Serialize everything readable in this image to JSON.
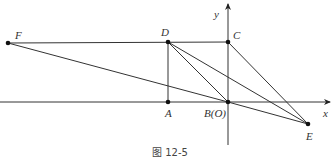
{
  "figure": {
    "caption": "图 12-5",
    "axes": {
      "x_label": "x",
      "y_label": "y"
    },
    "points": {
      "F": {
        "label": "F",
        "x": 8,
        "y": 43
      },
      "D": {
        "label": "D",
        "x": 168,
        "y": 42
      },
      "C": {
        "label": "C",
        "x": 228,
        "y": 42
      },
      "A": {
        "label": "A",
        "x": 168,
        "y": 102
      },
      "B": {
        "label": "B(O)",
        "x": 228,
        "y": 102
      },
      "E": {
        "label": "E",
        "x": 308,
        "y": 124
      }
    },
    "segments": [
      "FC",
      "FB",
      "DA",
      "DB",
      "DE",
      "CE",
      "BE"
    ],
    "colors": {
      "line": "#333333",
      "point": "#111111"
    }
  }
}
